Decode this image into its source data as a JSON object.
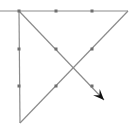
{
  "diagram": {
    "colors": {
      "background": "#ffffff",
      "line": "#8c8c8c",
      "dot": "#6e6e6e",
      "arrow": "#111111"
    },
    "dots": [
      {
        "x": 19,
        "y": 11
      },
      {
        "x": 56,
        "y": 11
      },
      {
        "x": 92,
        "y": 11
      },
      {
        "x": 19,
        "y": 49
      },
      {
        "x": 56,
        "y": 49
      },
      {
        "x": 92,
        "y": 49
      },
      {
        "x": 19,
        "y": 86
      },
      {
        "x": 56,
        "y": 86
      },
      {
        "x": 92,
        "y": 86
      }
    ],
    "segments": [
      {
        "name": "top-horizontal",
        "x1": 0,
        "y1": 11,
        "x2": 128,
        "y2": 11
      },
      {
        "name": "diagonal-up",
        "x1": 128,
        "y1": 11,
        "x2": 20,
        "y2": 123
      },
      {
        "name": "left-vertical",
        "x1": 20,
        "y1": 123,
        "x2": 19,
        "y2": 11
      },
      {
        "name": "diagonal-down-arrow",
        "x1": 19,
        "y1": 11,
        "x2": 104,
        "y2": 100
      }
    ],
    "arrow_tip": {
      "x": 104,
      "y": 100
    }
  }
}
